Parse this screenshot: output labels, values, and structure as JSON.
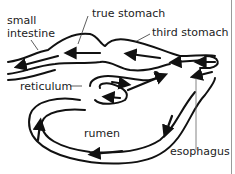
{
  "diagram": {
    "labels": {
      "small_intestine_line1": "small",
      "small_intestine_line2": "intestine",
      "true_stomach": "true stomach",
      "third_stomach": "third stomach",
      "reticulum": "reticulum",
      "rumen": "rumen",
      "esophagus": "esophagus"
    },
    "colors": {
      "ink": "#111111",
      "text": "#222222",
      "background": "#ffffff",
      "edge_line": "#9a9a9a"
    }
  }
}
